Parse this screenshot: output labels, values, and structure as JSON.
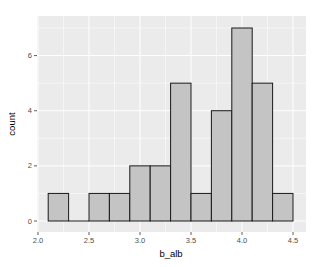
{
  "chart_data": {
    "type": "bar",
    "subtype": "histogram",
    "title": "",
    "xlabel": "b_alb",
    "ylabel": "count",
    "xlim": [
      2.0,
      4.55
    ],
    "ylim": [
      0,
      7.35
    ],
    "x_ticks": [
      2.0,
      2.5,
      3.0,
      3.5,
      4.0,
      4.5
    ],
    "x_tick_labels": [
      "2.0",
      "2.5",
      "3.0",
      "3.5",
      "4.0",
      "4.5"
    ],
    "y_ticks": [
      0,
      2,
      4,
      6
    ],
    "y_tick_labels": [
      "0",
      "2",
      "4",
      "6"
    ],
    "grid": true,
    "legend": "none",
    "bin_width": 0.2,
    "bins": [
      {
        "start": 2.1,
        "end": 2.3,
        "count": 1
      },
      {
        "start": 2.3,
        "end": 2.5,
        "count": 0
      },
      {
        "start": 2.5,
        "end": 2.7,
        "count": 1
      },
      {
        "start": 2.7,
        "end": 2.9,
        "count": 1
      },
      {
        "start": 2.9,
        "end": 3.1,
        "count": 2
      },
      {
        "start": 3.1,
        "end": 3.3,
        "count": 2
      },
      {
        "start": 3.3,
        "end": 3.5,
        "count": 5
      },
      {
        "start": 3.5,
        "end": 3.7,
        "count": 1
      },
      {
        "start": 3.7,
        "end": 3.9,
        "count": 4
      },
      {
        "start": 3.9,
        "end": 4.1,
        "count": 7
      },
      {
        "start": 4.1,
        "end": 4.3,
        "count": 5
      },
      {
        "start": 4.3,
        "end": 4.5,
        "count": 1
      }
    ],
    "categories": [
      "2.2",
      "2.4",
      "2.6",
      "2.8",
      "3.0",
      "3.2",
      "3.4",
      "3.6",
      "3.8",
      "4.0",
      "4.2",
      "4.4"
    ],
    "values": [
      1,
      0,
      1,
      1,
      2,
      2,
      5,
      1,
      4,
      7,
      5,
      1
    ]
  },
  "style": {
    "panel_bg": "#ebebeb",
    "grid_major": "#ffffff",
    "bar_fill": "#c4c4c4",
    "bar_stroke": "#1a1a1a",
    "tick_color": "#333333"
  }
}
